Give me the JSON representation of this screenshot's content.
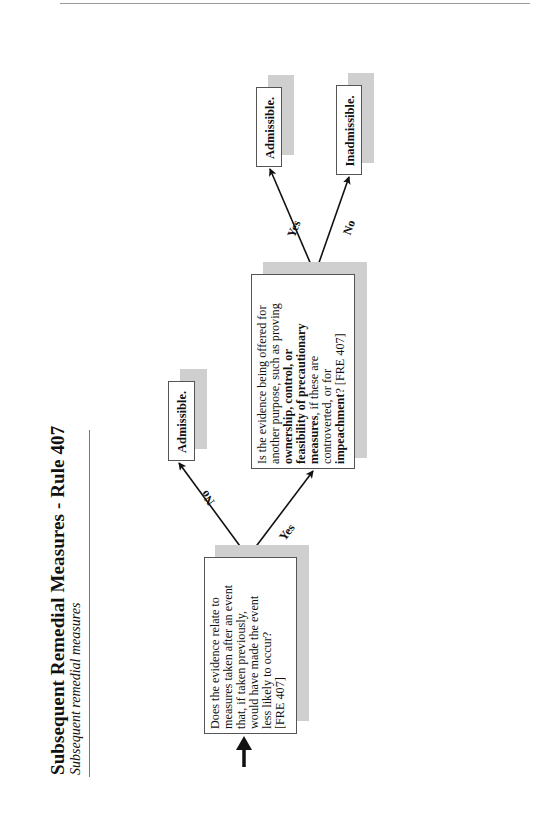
{
  "page": {
    "title": "Subsequent Remedial Measures - Rule 407",
    "subtitle": "Subsequent remedial measures"
  },
  "flowchart": {
    "nodes": {
      "q1": {
        "text": "Does the evidence relate to measures taken after an event that, if taken previously, would have made the event less likely to occur? [FRE 407]",
        "lines": [
          "Does the evidence relate to",
          "measures taken after an event",
          "that, if taken previously,",
          "would have made the event",
          "less likely to occur?",
          "[FRE 407]"
        ]
      },
      "q2": {
        "text": "Is the evidence being offered for another purpose, such as proving ownership, control, or feasibility of precautionary measures, if these are controverted, or for impeachment? [FRE 407]",
        "line1": "Is the evidence being offered for",
        "line2": "another purpose, such as proving",
        "line3_bold": "ownership, control, or",
        "line4_bold": "feasibility of precautionary",
        "line5_bold": "measures",
        "line5_rest": ", if these are",
        "line6": "controverted, or for",
        "line7_bold": "impeachment",
        "line7_rest": "? [FRE 407]"
      },
      "r1": {
        "text": "Admissible."
      },
      "r2": {
        "text": "Admissible."
      },
      "r3": {
        "text": "Inadmissible."
      }
    },
    "edges": [
      {
        "from": "start",
        "to": "q1",
        "label": ""
      },
      {
        "from": "q1",
        "to": "r1",
        "label": "No"
      },
      {
        "from": "q1",
        "to": "q2",
        "label": "Yes"
      },
      {
        "from": "q2",
        "to": "r2",
        "label": "Yes"
      },
      {
        "from": "q2",
        "to": "r3",
        "label": "No"
      }
    ],
    "edge_labels": {
      "q1_no": "No",
      "q1_yes": "Yes",
      "q2_yes": "Yes",
      "q2_no": "No"
    },
    "colors": {
      "shadow": "#cfcfcf",
      "border": "#555555",
      "arrow": "#111111"
    }
  }
}
